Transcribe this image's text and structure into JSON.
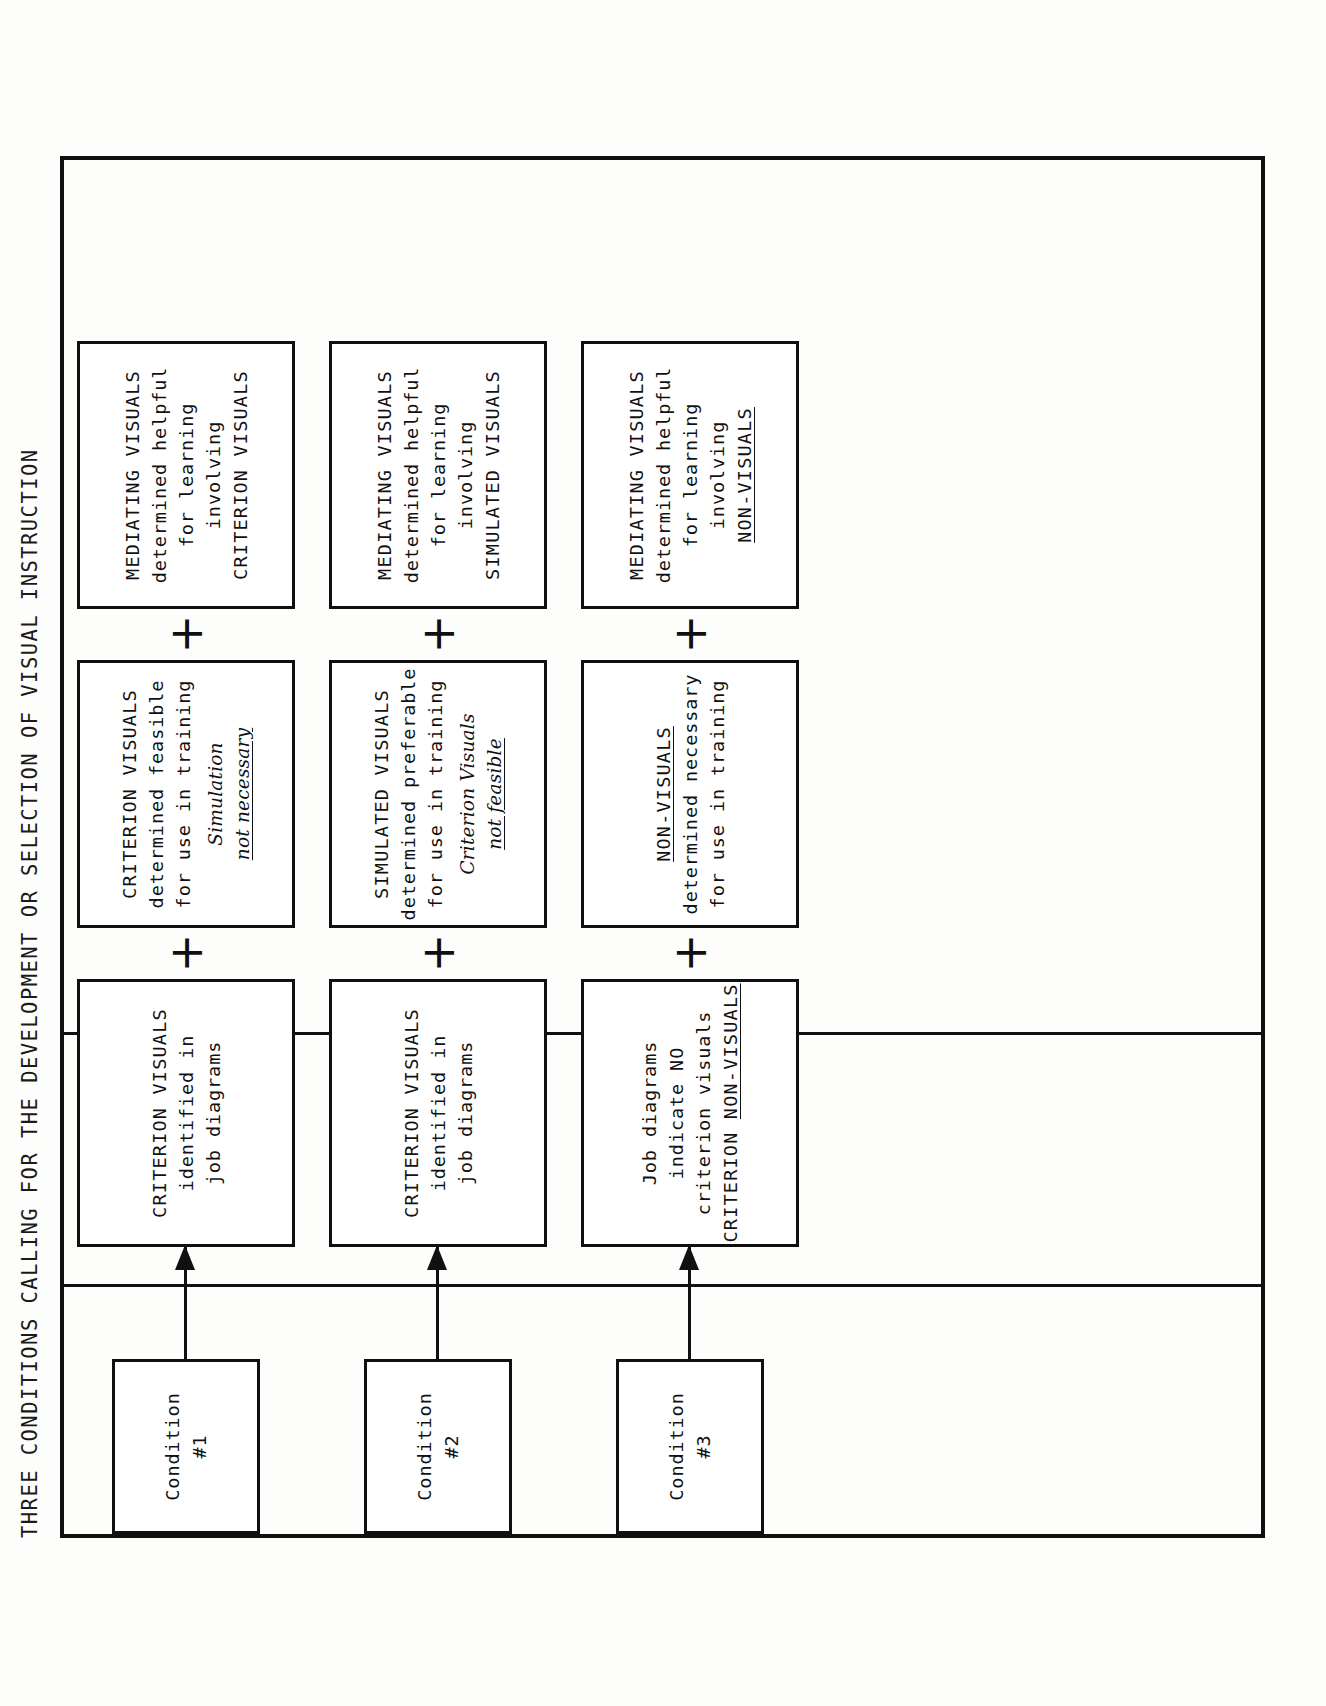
{
  "figure": {
    "caption": "THREE CONDITIONS CALLING FOR THE DEVELOPMENT OR SELECTION OF VISUAL INSTRUCTION",
    "plus_symbol": "+",
    "colors": {
      "ink": "#101010",
      "paper": "#fdfdfb"
    }
  },
  "conditions": [
    {
      "condition_label_line1": "Condition",
      "condition_label_line2": "#1",
      "stage1": {
        "line1": "CRITERION VISUALS",
        "line2": "identified in",
        "line3": "job diagrams"
      },
      "stage2": {
        "line1": "CRITERION VISUALS",
        "line2": "determined feasible",
        "line3": "for use in training",
        "italic1": "Simulation",
        "italic2": "not necessary"
      },
      "stage3": {
        "line1": "MEDIATING VISUALS",
        "line2": "determined helpful",
        "line3": "for learning",
        "line4": "involving",
        "line5": "CRITERION VISUALS"
      }
    },
    {
      "condition_label_line1": "Condition",
      "condition_label_line2": "#2",
      "stage1": {
        "line1": "CRITERION VISUALS",
        "line2": "identified in",
        "line3": "job diagrams"
      },
      "stage2": {
        "line1": "SIMULATED VISUALS",
        "line2": "determined preferable",
        "line3": "for use in training",
        "italic1": "Criterion Visuals",
        "italic2": "not feasible"
      },
      "stage3": {
        "line1": "MEDIATING VISUALS",
        "line2": "determined helpful",
        "line3": "for learning",
        "line4": "involving",
        "line5": "SIMULATED VISUALS"
      }
    },
    {
      "condition_label_line1": "Condition",
      "condition_label_line2": "#3",
      "stage1": {
        "line1": "Job diagrams",
        "line2": "indicate NO",
        "line3": "criterion visuals",
        "line4_prefix": "CRITERION ",
        "line4_underlined": "NON-VISUALS"
      },
      "stage2": {
        "line1_underlined": "NON-VISUALS",
        "line2": "determined necessary",
        "line3": "for use in training"
      },
      "stage3": {
        "line1": "MEDIATING VISUALS",
        "line2": "determined helpful",
        "line3": "for learning",
        "line4": "involving",
        "line5_underlined": "NON-VISUALS"
      }
    }
  ]
}
